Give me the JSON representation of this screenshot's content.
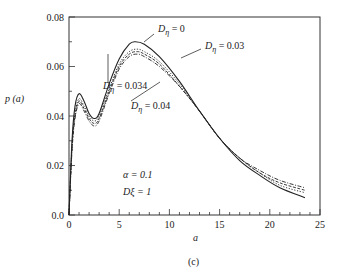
{
  "chart_data": {
    "type": "line",
    "title": "",
    "caption": "(c)",
    "xlabel": "a",
    "ylabel": "p (a)",
    "xlim": [
      0,
      25
    ],
    "ylim": [
      0.0,
      0.08
    ],
    "xticks": [
      0,
      5,
      10,
      15,
      20,
      25
    ],
    "xtick_labels": [
      "0",
      "5",
      "10",
      "15",
      "20",
      "25"
    ],
    "yticks": [
      0.0,
      0.02,
      0.04,
      0.06,
      0.08
    ],
    "ytick_labels": [
      "0.0",
      "0.02",
      "0.04",
      "0.06",
      "0.08"
    ],
    "grid": false,
    "legend": "inline annotations",
    "annotations": [
      {
        "text": "α = 0.1",
        "x": 10.6,
        "y": 0.013
      },
      {
        "text": "Dξ = 1",
        "x": 10.6,
        "y": 0.007
      }
    ],
    "series": [
      {
        "name": "Dη = 0",
        "style": "solid",
        "x": [
          0,
          0.3,
          0.6,
          1.0,
          1.5,
          2.0,
          2.5,
          3.0,
          4.0,
          5.0,
          6.0,
          6.6,
          7.5,
          9.0,
          11.0,
          13.0,
          15.0,
          17.0,
          19.0,
          21.0,
          23.5
        ],
        "y": [
          0,
          0.03,
          0.044,
          0.049,
          0.046,
          0.041,
          0.039,
          0.041,
          0.053,
          0.063,
          0.069,
          0.07,
          0.069,
          0.064,
          0.054,
          0.042,
          0.031,
          0.022,
          0.016,
          0.011,
          0.007
        ]
      },
      {
        "name": "Dη = 0.03",
        "style": "dotted",
        "x": [
          0,
          0.3,
          0.6,
          1.0,
          1.5,
          2.0,
          2.5,
          3.0,
          4.0,
          5.0,
          6.0,
          6.8,
          7.5,
          9.0,
          11.0,
          13.0,
          15.0,
          17.0,
          19.0,
          21.0,
          23.5
        ],
        "y": [
          0,
          0.028,
          0.041,
          0.047,
          0.044,
          0.04,
          0.038,
          0.04,
          0.051,
          0.061,
          0.066,
          0.067,
          0.066,
          0.062,
          0.053,
          0.042,
          0.031,
          0.023,
          0.017,
          0.012,
          0.009
        ]
      },
      {
        "name": "Dη = 0.034",
        "style": "dashed",
        "x": [
          0,
          0.3,
          0.6,
          1.0,
          1.5,
          2.0,
          2.5,
          3.0,
          4.0,
          5.0,
          6.0,
          6.8,
          7.5,
          9.0,
          11.0,
          13.0,
          15.0,
          17.0,
          19.0,
          21.0,
          23.5
        ],
        "y": [
          0,
          0.027,
          0.04,
          0.046,
          0.043,
          0.039,
          0.037,
          0.039,
          0.05,
          0.06,
          0.065,
          0.066,
          0.065,
          0.061,
          0.052,
          0.042,
          0.031,
          0.023,
          0.017,
          0.013,
          0.01
        ]
      },
      {
        "name": "Dη = 0.04",
        "style": "dash-dot",
        "x": [
          0,
          0.3,
          0.6,
          1.0,
          1.5,
          2.0,
          2.5,
          3.0,
          4.0,
          5.0,
          6.0,
          6.8,
          7.5,
          9.0,
          11.0,
          13.0,
          15.0,
          17.0,
          19.0,
          21.0,
          23.5
        ],
        "y": [
          0,
          0.026,
          0.039,
          0.045,
          0.042,
          0.038,
          0.036,
          0.038,
          0.049,
          0.059,
          0.064,
          0.065,
          0.064,
          0.06,
          0.052,
          0.042,
          0.031,
          0.023,
          0.018,
          0.014,
          0.011
        ]
      }
    ],
    "series_labels": [
      {
        "text": "Dη = 0",
        "label_x": 158,
        "label_y": 32
      },
      {
        "text": "Dη = 0.03",
        "label_x": 205,
        "label_y": 49
      },
      {
        "text": "Dη = 0.034",
        "label_x": 103,
        "label_y": 89
      },
      {
        "text": "Dη = 0.04",
        "label_x": 131,
        "label_y": 109
      }
    ]
  }
}
